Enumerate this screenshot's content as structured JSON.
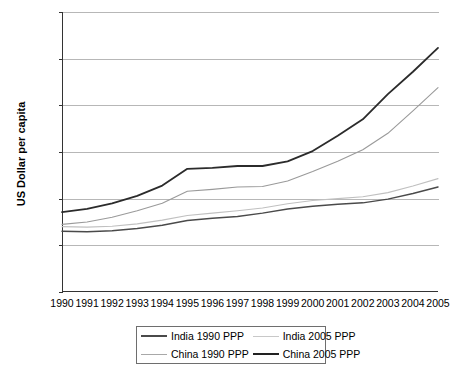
{
  "chart_data": {
    "type": "line",
    "title": "",
    "xlabel": "",
    "ylabel": "US Dollar per capita",
    "ylim": [
      0,
      6000
    ],
    "ytick_labels": [
      "6,000",
      "5,000",
      "4,000",
      "3,000",
      "2,000",
      "1,000",
      "0"
    ],
    "ytick_values": [
      6000,
      5000,
      4000,
      3000,
      2000,
      1000,
      0
    ],
    "grid": true,
    "legend_position": "bottom",
    "x": [
      1990,
      1991,
      1992,
      1993,
      1994,
      1995,
      1996,
      1997,
      1998,
      1999,
      2000,
      2001,
      2002,
      2003,
      2004,
      2005
    ],
    "categories": [
      "1990",
      "1991",
      "1992",
      "1993",
      "1994",
      "1995",
      "1996",
      "1997",
      "1998",
      "1999",
      "2000",
      "2001",
      "2002",
      "2003",
      "2004",
      "2005"
    ],
    "series": [
      {
        "name": "India 1990 PPP",
        "color": "#4a4a4a",
        "values": [
          1300,
          1290,
          1310,
          1360,
          1430,
          1530,
          1580,
          1620,
          1690,
          1780,
          1840,
          1880,
          1910,
          1990,
          2110,
          2250
        ]
      },
      {
        "name": "India 2005 PPP",
        "color": "#c0c0c0",
        "values": [
          1400,
          1390,
          1410,
          1460,
          1540,
          1640,
          1690,
          1740,
          1800,
          1890,
          1960,
          2000,
          2040,
          2130,
          2270,
          2430
        ]
      },
      {
        "name": "China 1990 PPP",
        "color": "#9a9a9a",
        "values": [
          1450,
          1500,
          1600,
          1740,
          1900,
          2160,
          2200,
          2250,
          2260,
          2380,
          2580,
          2800,
          3050,
          3400,
          3880,
          4380
        ]
      },
      {
        "name": "China 2005 PPP",
        "color": "#2b2b2b",
        "values": [
          1710,
          1780,
          1900,
          2060,
          2280,
          2640,
          2660,
          2700,
          2700,
          2800,
          3020,
          3350,
          3700,
          4240,
          4720,
          5230
        ]
      }
    ]
  },
  "legend": {
    "items": [
      {
        "label": "India 1990 PPP",
        "color": "#4a4a4a",
        "width": 2.2
      },
      {
        "label": "India 2005 PPP",
        "color": "#c8c8c8",
        "width": 1.4
      },
      {
        "label": "China 1990 PPP",
        "color": "#a8a8a8",
        "width": 1.4
      },
      {
        "label": "China 2005 PPP",
        "color": "#222222",
        "width": 2.6
      }
    ]
  },
  "axis": {
    "y_title": "US Dollar per capita"
  }
}
